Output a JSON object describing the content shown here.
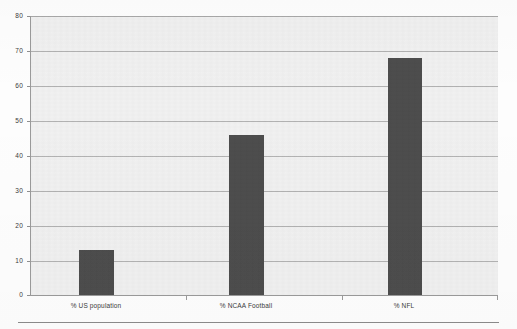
{
  "chart_data": {
    "type": "bar",
    "title": "",
    "subtitle": "",
    "xlabel": "",
    "ylabel": "",
    "categories": [
      "% US population",
      "% NCAA Football",
      "% NFL"
    ],
    "values": [
      13,
      46,
      68
    ],
    "series": [
      {
        "name": "",
        "values": [
          13,
          46,
          68
        ]
      }
    ],
    "ylim": [
      0,
      80
    ],
    "yticks": [
      0,
      10,
      20,
      30,
      40,
      50,
      60,
      70,
      80
    ],
    "ytick_labels": [
      "0",
      "10",
      "20",
      "30",
      "40",
      "50",
      "60",
      "70",
      "80"
    ],
    "grid": true,
    "grid_axis": "y",
    "legend": false,
    "legend_position": "none",
    "bar_color": "#4d4d4d",
    "plot_background": "#f1f1f1",
    "gridline_color": "#b3b3b3",
    "axis_color": "#9a9a9a"
  },
  "axis": {
    "y": {
      "ticks": [
        {
          "label": "80",
          "value": 80
        },
        {
          "label": "70",
          "value": 70
        },
        {
          "label": "60",
          "value": 60
        },
        {
          "label": "50",
          "value": 50
        },
        {
          "label": "40",
          "value": 40
        },
        {
          "label": "30",
          "value": 30
        },
        {
          "label": "20",
          "value": 20
        },
        {
          "label": "10",
          "value": 10
        },
        {
          "label": "0",
          "value": 0
        }
      ]
    },
    "x": {
      "ticks": [
        {
          "label": "% US population"
        },
        {
          "label": "% NCAA Football"
        },
        {
          "label": "% NFL"
        }
      ]
    }
  },
  "bars": [
    {
      "label": "% US population",
      "value": 13
    },
    {
      "label": "% NCAA Football",
      "value": 46
    },
    {
      "label": "% NFL",
      "value": 68
    }
  ]
}
